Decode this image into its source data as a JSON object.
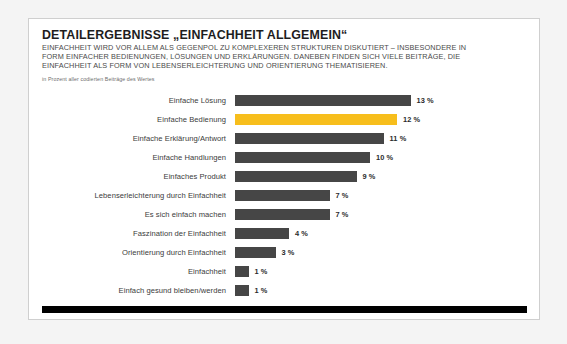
{
  "chart_data": {
    "type": "bar",
    "orientation": "horizontal",
    "title": "DETAILERGEBNISSE „EINFACHHEIT ALLGEMEIN“",
    "subtitle": "EINFACHHEIT WIRD VOR ALLEM ALS GEGENPOL ZU KOMPLEXEREN STRUKTUREN DISKUTIERT – INSBESONDERE IN FORM EINFACHER BEDIENUNGEN, LÖSUNGEN UND ERKLÄRUNGEN. DANEBEN FINDEN SICH VIELE BEITRÄGE, DIE EINFACHHEIT ALS FORM VON LEBENSERLEICHTERUNG UND ORIENTIERUNG THEMATISIEREN.",
    "note": "in Prozent aller codierten Beiträge des Wertes",
    "xlabel": "",
    "ylabel": "",
    "unit": "%",
    "xlim": [
      0,
      13
    ],
    "grid": false,
    "legend": "none",
    "bar_color": "#464646",
    "highlight_color": "#f7be1c",
    "categories": [
      "Einfache Lösung",
      "Einfache Bedienung",
      "Einfache Erklärung/Antwort",
      "Einfache Handlungen",
      "Einfaches Produkt",
      "Lebenserleichterung durch Einfachheit",
      "Es sich einfach machen",
      "Faszination der Einfachheit",
      "Orientierung durch Einfachheit",
      "Einfachheit",
      "Einfach gesund bleiben/werden"
    ],
    "values": [
      13,
      12,
      11,
      10,
      9,
      7,
      7,
      4,
      3,
      1,
      1
    ],
    "value_labels": [
      "13 %",
      "12 %",
      "11 %",
      "10 %",
      "9 %",
      "7 %",
      "7 %",
      "4 %",
      "3 %",
      "1 %",
      "1 %"
    ],
    "highlight_index": 1,
    "rows": [
      {
        "label": "Einfache Lösung",
        "value": 13,
        "value_label": "13 %",
        "highlight": false
      },
      {
        "label": "Einfache Bedienung",
        "value": 12,
        "value_label": "12 %",
        "highlight": true
      },
      {
        "label": "Einfache Erklärung/Antwort",
        "value": 11,
        "value_label": "11 %",
        "highlight": false
      },
      {
        "label": "Einfache Handlungen",
        "value": 10,
        "value_label": "10 %",
        "highlight": false
      },
      {
        "label": "Einfaches Produkt",
        "value": 9,
        "value_label": "9 %",
        "highlight": false
      },
      {
        "label": "Lebenserleichterung durch Einfachheit",
        "value": 7,
        "value_label": "7 %",
        "highlight": false
      },
      {
        "label": "Es sich einfach machen",
        "value": 7,
        "value_label": "7 %",
        "highlight": false
      },
      {
        "label": "Faszination der Einfachheit",
        "value": 4,
        "value_label": "4 %",
        "highlight": false
      },
      {
        "label": "Orientierung durch Einfachheit",
        "value": 3,
        "value_label": "3 %",
        "highlight": false
      },
      {
        "label": "Einfachheit",
        "value": 1,
        "value_label": "1 %",
        "highlight": false
      },
      {
        "label": "Einfach gesund bleiben/werden",
        "value": 1,
        "value_label": "1 %",
        "highlight": false
      }
    ]
  }
}
